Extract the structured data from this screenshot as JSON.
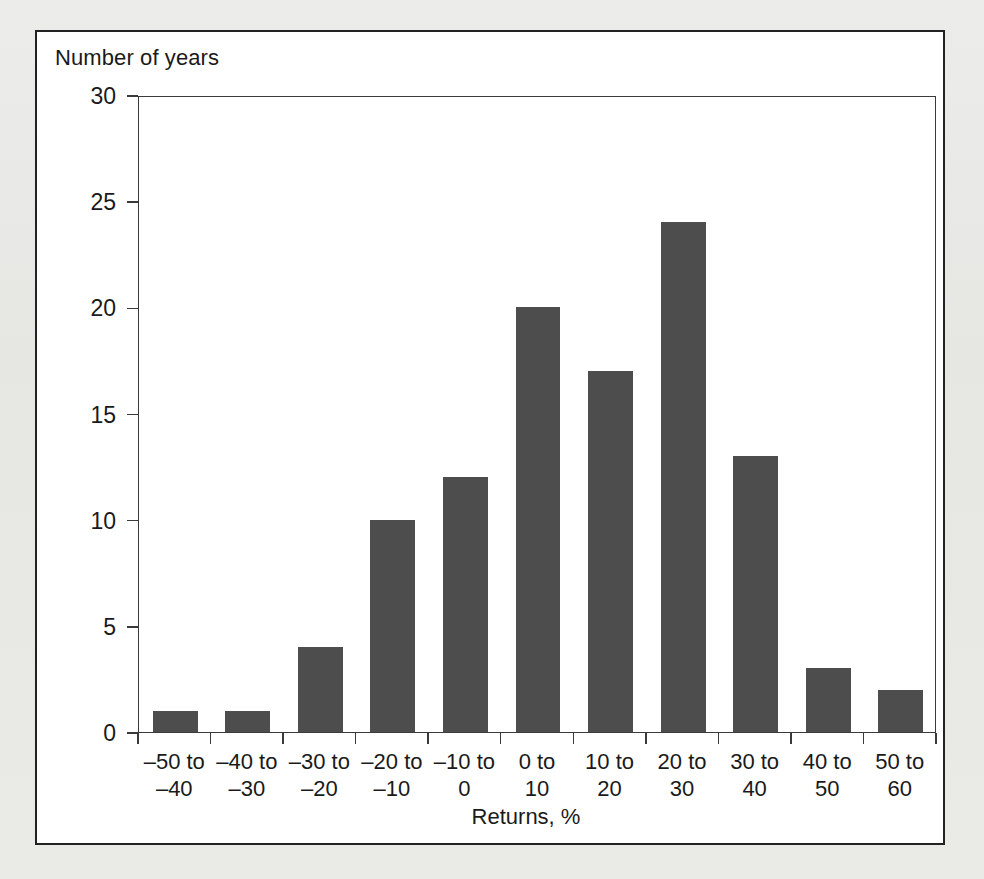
{
  "figure": {
    "background_color": "#ffffff",
    "page_color": "#e9e9e6",
    "border_color": "#222222"
  },
  "axes": {
    "y_title": "Number of years",
    "x_title": "Returns, %",
    "y_ticks": [
      "0",
      "5",
      "10",
      "15",
      "20",
      "25",
      "30"
    ],
    "bar_color": "#4d4d4d",
    "axis_color": "#3a3a3a"
  },
  "chart_data": {
    "type": "bar",
    "title": "",
    "subtitle": "",
    "xlabel": "Returns, %",
    "ylabel": "Number of years",
    "categories": [
      "–50 to\n–40",
      "–40 to\n–30",
      "–30 to\n–20",
      "–20 to\n–10",
      "–10 to\n0",
      "0 to\n10",
      "10 to\n20",
      "20 to\n30",
      "30 to\n40",
      "40 to\n50",
      "50 to\n60"
    ],
    "category_lines": [
      [
        "–50 to",
        "–40"
      ],
      [
        "–40 to",
        "–30"
      ],
      [
        "–30 to",
        "–20"
      ],
      [
        "–20 to",
        "–10"
      ],
      [
        "–10 to",
        "0"
      ],
      [
        "0 to",
        "10"
      ],
      [
        "10 to",
        "20"
      ],
      [
        "20 to",
        "30"
      ],
      [
        "30 to",
        "40"
      ],
      [
        "40 to",
        "50"
      ],
      [
        "50 to",
        "60"
      ]
    ],
    "values": [
      1,
      1,
      4,
      10,
      12,
      20,
      17,
      24,
      13,
      3,
      2
    ],
    "ylim": [
      0,
      30
    ],
    "ytick_values": [
      0,
      5,
      10,
      15,
      20,
      25,
      30
    ],
    "grid": false,
    "legend": false,
    "legend_position": "none",
    "series": [
      {
        "name": "Number of years",
        "values": [
          1,
          1,
          4,
          10,
          12,
          20,
          17,
          24,
          13,
          3,
          2
        ]
      }
    ]
  }
}
